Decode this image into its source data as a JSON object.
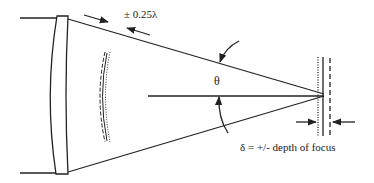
{
  "diagram": {
    "type": "optical focus diagram",
    "labels": {
      "wavefront_tolerance": "± 0.25λ",
      "angle": "θ",
      "depth_of_focus": "δ = +/- depth of focus"
    },
    "elements": [
      "lens",
      "upper-ray",
      "lower-ray",
      "optical-axis",
      "wavefront-curves",
      "focal-plane-lines",
      "angle-arrows",
      "tolerance-arrows",
      "depth-arrows"
    ],
    "colors": {
      "stroke": "#222222",
      "background": "#ffffff"
    }
  }
}
